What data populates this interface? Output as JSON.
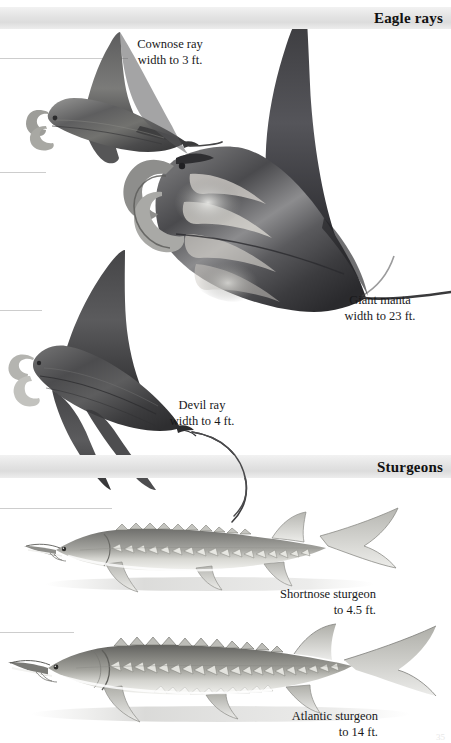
{
  "page": {
    "width": 451,
    "height": 743,
    "background": "#ffffff",
    "page_number": "35"
  },
  "sections": [
    {
      "id": "eagle-rays",
      "band_label": "Eagle rays",
      "band_top": 7,
      "band_height": 22,
      "band_color": "#e3e3e3"
    },
    {
      "id": "sturgeons",
      "band_label": "Sturgeons",
      "band_top": 455,
      "band_height": 23,
      "band_color": "#e3e3e3"
    }
  ],
  "guide_lines": [
    {
      "y": 58,
      "width": 120
    },
    {
      "y": 172,
      "width": 44
    },
    {
      "y": 310,
      "width": 40
    },
    {
      "y": 508,
      "width": 110
    },
    {
      "y": 632,
      "width": 70
    }
  ],
  "captions": [
    {
      "id": "cownose-ray",
      "line1": "Cownose ray",
      "line2": "width to 3 ft.",
      "left": 122,
      "top": 38,
      "align": "center"
    },
    {
      "id": "giant-manta",
      "line1": "Giant manta",
      "line2": "width to 23 ft.",
      "left": 330,
      "top": 294,
      "align": "center"
    },
    {
      "id": "devil-ray",
      "line1": "Devil ray",
      "line2": "width to 4 ft.",
      "left": 160,
      "top": 399,
      "align": "center"
    },
    {
      "id": "shortnose-sturgeon",
      "line1": "Shortnose sturgeon",
      "line2": "to 4.5 ft.",
      "left": 258,
      "top": 588,
      "align": "right"
    },
    {
      "id": "atlantic-sturgeon",
      "line1": "Atlantic sturgeon",
      "line2": "to 14 ft.",
      "left": 268,
      "top": 710,
      "align": "right"
    }
  ],
  "illustrations": [
    {
      "id": "cownose-ray-illustration",
      "species": "Cownose ray",
      "kind": "ray"
    },
    {
      "id": "giant-manta-illustration",
      "species": "Giant manta",
      "kind": "ray"
    },
    {
      "id": "devil-ray-illustration",
      "species": "Devil ray",
      "kind": "ray"
    },
    {
      "id": "shortnose-sturgeon-illustration",
      "species": "Shortnose sturgeon",
      "kind": "sturgeon"
    },
    {
      "id": "atlantic-sturgeon-illustration",
      "species": "Atlantic sturgeon",
      "kind": "sturgeon"
    }
  ]
}
